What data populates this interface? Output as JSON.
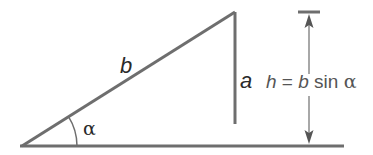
{
  "diagram": {
    "type": "triangle-height-diagram",
    "colors": {
      "line": "#6e6e6e",
      "label": "#2a2a2a",
      "formula": "#555555",
      "background": "#ffffff"
    },
    "labels": {
      "hypotenuse": "b",
      "side": "a",
      "angle": "α",
      "formula_h": "h",
      "formula_eq": " = ",
      "formula_b": "b",
      "formula_sin": " sin ",
      "formula_alpha": "α"
    },
    "geometry": {
      "left_vertex": [
        22,
        146
      ],
      "apex": [
        235,
        12
      ],
      "side_a_bottom": [
        235,
        124
      ],
      "baseline": {
        "x1": 20,
        "x2": 344,
        "y": 146
      },
      "height_arrow": {
        "x": 309,
        "y_top": 12,
        "y_bottom": 146
      },
      "top_tick": {
        "x1": 298,
        "x2": 320,
        "y": 12
      },
      "angle_arc_radius": 55
    }
  }
}
